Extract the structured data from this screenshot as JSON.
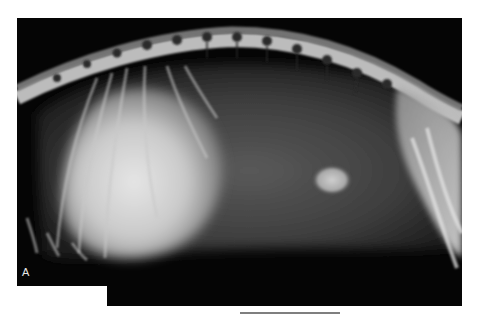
{
  "figure": {
    "panel_label": "A",
    "colors": {
      "background": "#ffffff",
      "film": "#050505",
      "bone": "#d8d8d8",
      "soft_tissue": "#7a7a7a",
      "label": "#e8e8e8"
    }
  }
}
